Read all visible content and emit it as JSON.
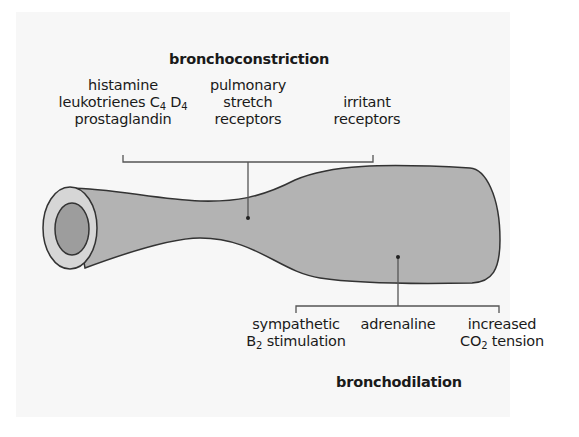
{
  "diagram": {
    "type": "bronchus-airway-schematic",
    "colors": {
      "background": "#f7f7f7",
      "tube_fill": "#b3b3b3",
      "tube_end_ring": "#d6d6d6",
      "lumen": "#9d9d9d",
      "outline": "#333333"
    },
    "bronchoconstriction": {
      "title": "bronchoconstriction",
      "causes": [
        {
          "lines": [
            "histamine",
            "leukotrienes C",
            "4",
            " D",
            "4",
            "prostaglandin"
          ],
          "line1": "histamine",
          "line2_a": "leukotrienes C",
          "line2_sub1": "4",
          "line2_b": " D",
          "line2_sub2": "4",
          "line3": "prostaglandin"
        },
        {
          "line1": "pulmonary",
          "line2": "stretch",
          "line3": "receptors"
        },
        {
          "line1": "irritant",
          "line2": "receptors"
        }
      ]
    },
    "bronchodilation": {
      "title": "bronchodilation",
      "causes": [
        {
          "line1": "sympathetic",
          "line2_a": "B",
          "line2_sub": "2",
          "line2_b": " stimulation"
        },
        {
          "line1": "adrenaline"
        },
        {
          "line1": "increased",
          "line2_a": "CO",
          "line2_sub": "2",
          "line2_b": " tension"
        }
      ]
    }
  }
}
